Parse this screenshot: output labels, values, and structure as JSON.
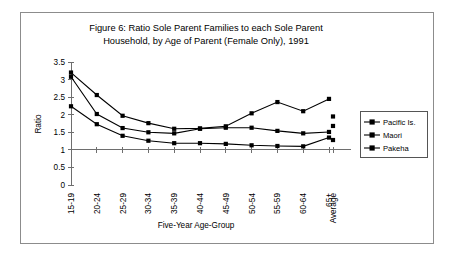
{
  "figure": {
    "title_line1": "Figure 6:      Ratio Sole Parent Families to each Sole Parent",
    "title_line2": "Household, by Age of Parent (Female Only), 1991",
    "border_color": "#8c8c8c"
  },
  "chart_data": {
    "type": "line",
    "xlabel": "Five-Year Age-Group",
    "ylabel": "Ratio",
    "categories": [
      "15-19",
      "20-24",
      "25-29",
      "30-34",
      "35-39",
      "40-44",
      "45-49",
      "50-54",
      "55-59",
      "60-64",
      "65+"
    ],
    "extra_category": "Average",
    "ylim": [
      0,
      3.5
    ],
    "yticks": [
      0,
      0.5,
      1,
      1.5,
      2,
      2.5,
      3,
      3.5
    ],
    "ytick_labels": [
      "0",
      "0.5",
      "1",
      "1.5",
      "2",
      "2.5",
      "3",
      "3.5"
    ],
    "grid": false,
    "legend_position": "right",
    "marker": "square",
    "series": [
      {
        "name": "Pacific Is.",
        "color": "#000000",
        "values": [
          3.2,
          2.56,
          1.97,
          1.76,
          1.6,
          1.61,
          1.67,
          2.04,
          2.36,
          2.1,
          2.45
        ],
        "average": 1.95
      },
      {
        "name": "Maori",
        "color": "#000000",
        "values": [
          3.08,
          2.02,
          1.62,
          1.5,
          1.47,
          1.6,
          1.63,
          1.63,
          1.54,
          1.47,
          1.51
        ],
        "average": 1.68
      },
      {
        "name": "Pakeha",
        "color": "#000000",
        "values": [
          2.24,
          1.73,
          1.4,
          1.26,
          1.19,
          1.19,
          1.17,
          1.13,
          1.11,
          1.1,
          1.35
        ],
        "average": 1.28
      }
    ]
  }
}
